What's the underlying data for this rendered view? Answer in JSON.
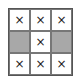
{
  "grid": {
    "rows": 3,
    "cols": 3,
    "shaded_color": "#a8a8a8",
    "cells": [
      {
        "mark": "×",
        "shaded": false
      },
      {
        "mark": "×",
        "shaded": false
      },
      {
        "mark": "×",
        "shaded": false
      },
      {
        "mark": "",
        "shaded": true
      },
      {
        "mark": "×",
        "shaded": false
      },
      {
        "mark": "",
        "shaded": true
      },
      {
        "mark": "×",
        "shaded": false
      },
      {
        "mark": "×",
        "shaded": false
      },
      {
        "mark": "×",
        "shaded": false
      }
    ]
  }
}
